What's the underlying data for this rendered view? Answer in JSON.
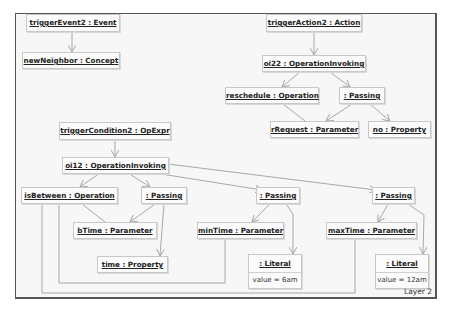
{
  "diagram": {
    "layer_label": "Layer 2",
    "nodes": {
      "triggerEvent2": {
        "title": "triggerEvent2 : Event"
      },
      "newNeighbor": {
        "title": "newNeighbor : Concept"
      },
      "triggerAction2": {
        "title": "triggerAction2 : Action"
      },
      "oi22": {
        "title": "oi22 : OperationInvoking"
      },
      "reschedule": {
        "title": "reschedule : Operation"
      },
      "passingTop": {
        "title": ": Passing"
      },
      "rRequest": {
        "title": "rRequest : Parameter"
      },
      "no": {
        "title": "no : Property"
      },
      "triggerCondition2": {
        "title": "triggerCondition2 : OpExpr"
      },
      "oi12": {
        "title": "oi12 : OperationInvoking"
      },
      "isBetween": {
        "title": "isBetween : Operation"
      },
      "passingLeft": {
        "title": ": Passing"
      },
      "bTime": {
        "title": "bTime : Parameter"
      },
      "time": {
        "title": "time : Property"
      },
      "passingMid": {
        "title": ": Passing"
      },
      "minTime": {
        "title": "minTime : Parameter"
      },
      "literal6am": {
        "title": ": Literal",
        "attr": "value = 6am"
      },
      "passingRight": {
        "title": ": Passing"
      },
      "maxTime": {
        "title": "maxTime : Parameter"
      },
      "literal12am": {
        "title": ": Literal",
        "attr": "value = 12am"
      }
    },
    "colors": {
      "frame_border": "#555555",
      "node_border": "#c8c8c8",
      "edge": "#a8a8a8",
      "diamond": "#9a9a9a"
    }
  }
}
